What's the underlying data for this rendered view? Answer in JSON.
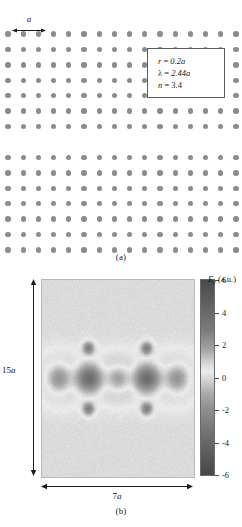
{
  "figure": {
    "panel_a": {
      "label": "(a)",
      "scale_label": "a",
      "lattice": {
        "columns": 16,
        "rows_above_defect": 7,
        "rows_below_defect": 7,
        "defect_rows_missing": 1,
        "rod_color": "#8c8c8c",
        "background": "#ffffff"
      },
      "parameters": [
        {
          "symbol": "r",
          "equals": "=",
          "value": "0.2a"
        },
        {
          "symbol": "λ",
          "equals": "=",
          "value": "2.44a"
        },
        {
          "symbol": "n",
          "equals": "=",
          "value": "3.4"
        }
      ],
      "parameter_lines": {
        "radius": "r = 0.2a",
        "wavelength": "λ = 2.44a",
        "index": "n = 3.4"
      }
    },
    "panel_b": {
      "label": "(b)",
      "field_title_symbol": "E",
      "field_title_subscript": "y",
      "field_title_units": "(a.u.)",
      "dim_vertical": "15a",
      "dim_horizontal": "7a",
      "colorbar": {
        "ticks": [
          "6",
          "4",
          "2",
          "0",
          "-2",
          "-4",
          "-6"
        ],
        "max": 6,
        "min": -6,
        "background_value": 0
      }
    }
  },
  "chart_data": {
    "type": "heatmap",
    "xlabel": "7a",
    "ylabel": "15a",
    "zlabel": "E_y (a.u.)",
    "grid": false,
    "legend": "colorbar-right",
    "colormap": "gray-diverging",
    "zlim": [
      -6,
      6
    ],
    "colorbar_ticks": [
      6,
      4,
      2,
      0,
      -2,
      -4,
      -6
    ],
    "background_level": 0,
    "lobes": [
      {
        "index": 1,
        "x_frac": 0.11,
        "y_frac": 0.5,
        "amplitude": -5.0,
        "rx_frac": 0.085,
        "ry_frac": 0.075
      },
      {
        "index": 2,
        "x_frac": 0.31,
        "y_frac": 0.5,
        "amplitude": -5.6,
        "rx_frac": 0.095,
        "ry_frac": 0.07
      },
      {
        "index": 3,
        "x_frac": 0.5,
        "y_frac": 0.5,
        "amplitude": -4.8,
        "rx_frac": 0.08,
        "ry_frac": 0.07
      },
      {
        "index": 4,
        "x_frac": 0.69,
        "y_frac": 0.5,
        "amplitude": -5.6,
        "rx_frac": 0.095,
        "ry_frac": 0.07
      },
      {
        "index": 5,
        "x_frac": 0.89,
        "y_frac": 0.5,
        "amplitude": -5.0,
        "rx_frac": 0.085,
        "ry_frac": 0.075
      }
    ],
    "halos": [
      {
        "x_frac": 0.11,
        "y_frac": 0.5,
        "amplitude": 3.2,
        "rx_frac": 0.125,
        "ry_frac": 0.11
      },
      {
        "x_frac": 0.31,
        "y_frac": 0.5,
        "amplitude": 1.4,
        "rx_frac": 0.13,
        "ry_frac": 0.105
      },
      {
        "x_frac": 0.5,
        "y_frac": 0.5,
        "amplitude": 3.4,
        "rx_frac": 0.12,
        "ry_frac": 0.105
      },
      {
        "x_frac": 0.69,
        "y_frac": 0.5,
        "amplitude": 1.4,
        "rx_frac": 0.13,
        "ry_frac": 0.105
      },
      {
        "x_frac": 0.89,
        "y_frac": 0.5,
        "amplitude": 3.2,
        "rx_frac": 0.125,
        "ry_frac": 0.11
      }
    ],
    "satellites": [
      {
        "x_frac": 0.305,
        "y_frac": 0.345,
        "amplitude": 2.6,
        "rx_frac": 0.04,
        "ry_frac": 0.035
      },
      {
        "x_frac": 0.305,
        "y_frac": 0.655,
        "amplitude": 2.6,
        "rx_frac": 0.04,
        "ry_frac": 0.035
      },
      {
        "x_frac": 0.69,
        "y_frac": 0.345,
        "amplitude": 2.6,
        "rx_frac": 0.04,
        "ry_frac": 0.035
      },
      {
        "x_frac": 0.69,
        "y_frac": 0.655,
        "amplitude": 2.6,
        "rx_frac": 0.04,
        "ry_frac": 0.035
      }
    ]
  }
}
